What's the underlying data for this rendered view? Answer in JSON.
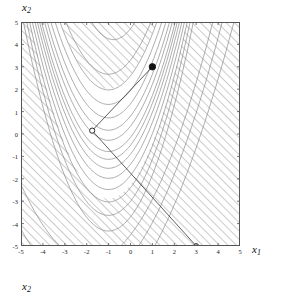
{
  "figure": {
    "kind": "contour-plot",
    "background": "#ffffff",
    "frame_color": "#555555",
    "contour_color": "#7a7a7a",
    "hatch_color": "#b8b8b8",
    "line_color": "#333333",
    "point_color": "#111111"
  },
  "axes": {
    "x_axis_label": "x",
    "x_axis_sub": "1",
    "y_axis_label": "x",
    "y_axis_sub": "2",
    "y_axis_label_bottom": "x",
    "y_axis_sub_bottom": "2",
    "xlim": [
      -5,
      5
    ],
    "ylim": [
      -5,
      5
    ],
    "xticks": [
      "-5",
      "-4",
      "-3",
      "-2",
      "-1",
      "0",
      "1",
      "2",
      "3",
      "4",
      "5"
    ],
    "yticks": [
      "5",
      "4",
      "3",
      "2",
      "1",
      "0",
      "-1",
      "-2",
      "-3",
      "-4",
      "-5"
    ],
    "xtick_values": [
      -5,
      -4,
      -3,
      -2,
      -1,
      0,
      1,
      2,
      3,
      4,
      5
    ],
    "ytick_values": [
      5,
      4,
      3,
      2,
      1,
      0,
      -1,
      -2,
      -3,
      -4,
      -5
    ],
    "grid": false
  },
  "chart_data": {
    "type": "line",
    "title": "",
    "xlabel": "x1",
    "ylabel": "x2",
    "xlim": [
      -5,
      5
    ],
    "ylim": [
      -5,
      5
    ],
    "grid": false,
    "legend": "none",
    "contours": {
      "family": "rosenbrock-like",
      "levels": [
        1,
        5,
        20,
        50,
        100,
        200,
        350,
        550,
        800,
        1100,
        1500,
        2000,
        2600
      ],
      "count": 13,
      "minimum_approx": [
        -1.75,
        0.15
      ]
    },
    "hatch_regions": [
      {
        "name": "upper-left-hatch",
        "corner": "top-left",
        "angle_deg": -45
      },
      {
        "name": "lower-right-hatch",
        "corner": "bottom-right",
        "angle_deg": -45
      }
    ],
    "series": [
      {
        "name": "search-line",
        "type": "line",
        "x": [
          1.0,
          -1.75,
          3.0
        ],
        "y": [
          3.0,
          0.15,
          -5.0
        ],
        "note": "segment from start point through the interior point and on to the boundary point"
      }
    ],
    "points": [
      {
        "name": "start-point",
        "x": 1.0,
        "y": 3.0,
        "marker": "filled-circle",
        "size": 3.2
      },
      {
        "name": "interior-point",
        "x": -1.75,
        "y": 0.15,
        "marker": "open-circle",
        "size": 2.6
      },
      {
        "name": "boundary-point",
        "x": 3.0,
        "y": -5.0,
        "marker": "open-circle",
        "size": 2.4
      }
    ]
  }
}
